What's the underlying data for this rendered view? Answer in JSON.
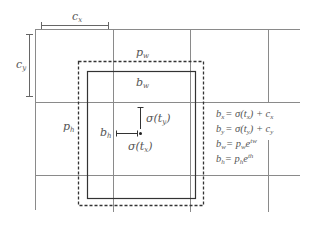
{
  "figure": {
    "type": "bounding-box-prediction-diagram",
    "colors": {
      "grid": "#8a8a8a",
      "box": "#333333",
      "prior_box_dashed": "#333333",
      "text": "#555555"
    },
    "labels": {
      "cx": "c",
      "cx_sub": "x",
      "cy": "c",
      "cy_sub": "y",
      "pw": "p",
      "pw_sub": "w",
      "ph": "p",
      "ph_sub": "h",
      "bw": "b",
      "bw_sub": "w",
      "bh": "b",
      "bh_sub": "h",
      "sigma_ty": "σ(t",
      "sigma_ty_sub": "y",
      "sigma_ty_close": ")",
      "sigma_tx": "σ(t",
      "sigma_tx_sub": "x",
      "sigma_tx_close": ")"
    },
    "equations": [
      {
        "lhs": "b",
        "lhs_sub": "x",
        "rhs": "= σ(t",
        "rhs_sub": "x",
        "rhs_tail": ") + c",
        "tail_sub": "x"
      },
      {
        "lhs": "b",
        "lhs_sub": "y",
        "rhs": "= σ(t",
        "rhs_sub": "y",
        "rhs_tail": ") + c",
        "tail_sub": "y"
      },
      {
        "lhs": "b",
        "lhs_sub": "w",
        "rhs": "= p",
        "rhs_sub": "w",
        "rhs_tail": "e",
        "tail_sup": "tw"
      },
      {
        "lhs": "b",
        "lhs_sub": "h",
        "rhs": "= p",
        "rhs_sub": "h",
        "rhs_tail": "e",
        "tail_sup": "th"
      }
    ]
  }
}
